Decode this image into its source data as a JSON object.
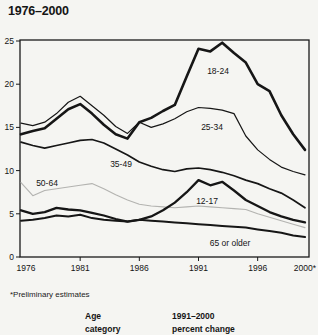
{
  "title": "1976–2000",
  "footnote": "*Preliminary estimates",
  "table_header": {
    "col1_line1": "Age",
    "col1_line2": "category",
    "col2_line1": "1991–2000",
    "col2_line2": "percent change"
  },
  "colors": {
    "line_black": "#161616",
    "line_gray": "#b3b3b0",
    "frame": "#1a1a1a",
    "background": "#f5f5f2"
  },
  "chart_data": {
    "type": "line",
    "title": "1976–2000",
    "xlabel": "",
    "ylabel": "",
    "ylim": [
      0,
      25
    ],
    "yticks": [
      0,
      5,
      10,
      15,
      20,
      25
    ],
    "grid": false,
    "legend_position": "inline-labels",
    "xticks": [
      {
        "year": 1976,
        "label": "1976"
      },
      {
        "year": 1981,
        "label": "1981"
      },
      {
        "year": 1986,
        "label": "1986"
      },
      {
        "year": 1991,
        "label": "1991"
      },
      {
        "year": 1996,
        "label": "1996"
      },
      {
        "year": 2000,
        "label": "2000*"
      }
    ],
    "x": [
      1976,
      1977,
      1978,
      1979,
      1980,
      1981,
      1982,
      1983,
      1984,
      1985,
      1986,
      1987,
      1988,
      1989,
      1990,
      1991,
      1992,
      1993,
      1994,
      1995,
      1996,
      1997,
      1998,
      1999,
      2000
    ],
    "series": [
      {
        "name": "18-24",
        "style": "black-thick",
        "stroke_width": 2.6,
        "values": [
          14.2,
          14.6,
          14.9,
          16.0,
          17.1,
          17.7,
          16.6,
          15.3,
          14.2,
          13.7,
          15.6,
          16.1,
          16.9,
          17.6,
          20.9,
          24.1,
          23.8,
          24.8,
          23.6,
          22.5,
          20.0,
          19.2,
          16.4,
          14.2,
          12.4
        ],
        "label": {
          "text": "18-24",
          "x": 218,
          "y": 74
        }
      },
      {
        "name": "25-34",
        "style": "black-thin",
        "stroke_width": 1.2,
        "values": [
          15.5,
          15.2,
          15.6,
          16.6,
          17.9,
          18.6,
          17.5,
          16.4,
          15.1,
          14.3,
          15.6,
          15.0,
          15.4,
          16.0,
          16.8,
          17.3,
          17.2,
          17.0,
          16.6,
          14.0,
          12.4,
          11.3,
          10.4,
          9.9,
          9.5
        ],
        "label": {
          "text": "25-34",
          "x": 212,
          "y": 130
        }
      },
      {
        "name": "35-49",
        "style": "black-medium",
        "stroke_width": 1.7,
        "values": [
          13.3,
          12.9,
          12.6,
          12.9,
          13.2,
          13.5,
          13.6,
          13.2,
          12.5,
          11.8,
          11.0,
          10.5,
          10.1,
          9.9,
          10.2,
          10.3,
          10.1,
          9.8,
          9.4,
          8.9,
          8.5,
          7.9,
          7.4,
          6.6,
          5.7
        ],
        "label": {
          "text": "35-49",
          "x": 121,
          "y": 167
        }
      },
      {
        "name": "50-64",
        "style": "gray-thin",
        "stroke_width": 1.1,
        "values": [
          8.6,
          7.1,
          7.7,
          7.9,
          8.1,
          8.3,
          8.5,
          7.9,
          7.2,
          6.6,
          6.1,
          5.9,
          5.8,
          5.7,
          5.8,
          5.9,
          5.8,
          5.7,
          5.6,
          5.5,
          5.0,
          4.6,
          4.2,
          3.8,
          3.4
        ],
        "label": {
          "text": "50-64",
          "x": 47,
          "y": 186
        }
      },
      {
        "name": "12-17",
        "style": "black-thick",
        "stroke_width": 2.3,
        "values": [
          5.4,
          5.0,
          5.2,
          5.7,
          5.5,
          5.4,
          5.1,
          4.8,
          4.4,
          4.1,
          4.3,
          4.7,
          5.4,
          6.3,
          7.5,
          8.9,
          8.3,
          8.7,
          7.7,
          6.6,
          5.9,
          5.2,
          4.7,
          4.3,
          4.0
        ],
        "label": {
          "text": "12-17",
          "x": 207,
          "y": 204
        }
      },
      {
        "name": "65 or older",
        "style": "black-medium",
        "stroke_width": 2.0,
        "values": [
          4.2,
          4.3,
          4.5,
          4.8,
          4.7,
          4.9,
          4.5,
          4.3,
          4.2,
          4.1,
          4.3,
          4.2,
          4.1,
          4.0,
          3.9,
          3.8,
          3.7,
          3.6,
          3.5,
          3.4,
          3.2,
          3.0,
          2.8,
          2.5,
          2.3
        ],
        "label": {
          "text": "65 or older",
          "x": 230,
          "y": 246
        }
      }
    ]
  }
}
